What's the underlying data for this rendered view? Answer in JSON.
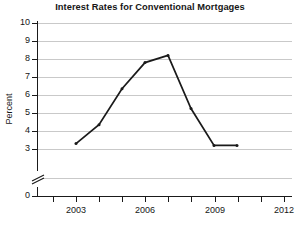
{
  "chart_data": {
    "type": "line",
    "title": "Interest Rates for Conventional Mortgages",
    "xlabel": "",
    "ylabel": "Percent",
    "x": [
      2003,
      2004,
      2005,
      2006,
      2007,
      2008,
      2009,
      2010
    ],
    "values": [
      3.3,
      4.35,
      6.35,
      7.8,
      8.2,
      5.25,
      3.2,
      3.2
    ],
    "series": [
      {
        "name": "Interest Rate",
        "values": [
          3.3,
          4.35,
          6.35,
          7.8,
          8.2,
          5.25,
          3.2,
          3.2
        ]
      }
    ],
    "xtick_labels": [
      "2003",
      "2006",
      "2009",
      "2012"
    ],
    "xtick_values": [
      2003,
      2006,
      2009,
      2012
    ],
    "xtick_minor_values": [
      2002,
      2004,
      2005,
      2007,
      2008,
      2010,
      2011
    ],
    "ytick_labels": [
      "0",
      "3",
      "4",
      "5",
      "6",
      "7",
      "8",
      "9",
      "10"
    ],
    "ytick_values": [
      0,
      3,
      4,
      5,
      6,
      7,
      8,
      9,
      10
    ],
    "ylim": [
      0,
      10
    ],
    "xlim": [
      2002,
      2012.3
    ],
    "axis_break": true,
    "axis_break_between": [
      0,
      3
    ],
    "grid": true,
    "grid_axis": "y",
    "legend": false,
    "line_color": "#1a1a1a",
    "grid_color": "#c9c9c9",
    "marker": "point"
  },
  "ticks": {
    "y": [
      {
        "label": "10",
        "top": 23
      },
      {
        "label": "9",
        "top": 41
      },
      {
        "label": "8",
        "top": 59
      },
      {
        "label": "7",
        "top": 77
      },
      {
        "label": "6",
        "top": 95
      },
      {
        "label": "5",
        "top": 113
      },
      {
        "label": "4",
        "top": 131
      },
      {
        "label": "3",
        "top": 149
      },
      {
        "label": "0",
        "top": 196
      }
    ],
    "x": [
      {
        "label": "2003",
        "left": 76
      },
      {
        "label": "2006",
        "left": 145
      },
      {
        "label": "2009",
        "left": 215
      },
      {
        "label": "2012",
        "left": 284
      }
    ],
    "x_minor_left": [
      53,
      99,
      122,
      168,
      191,
      238,
      261
    ]
  },
  "polyline": "76,160 99,139 122,103 145,66 168,58 191,113 215,154 238,154"
}
